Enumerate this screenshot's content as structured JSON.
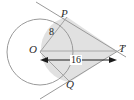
{
  "figure": {
    "type": "geometry-diagram",
    "width": 134,
    "height": 100,
    "background": "#ffffff"
  },
  "colors": {
    "stroke": "#8f8f8f",
    "stroke_dark": "#6f6f6f",
    "shade_fill": "#dcdcdc",
    "label_text": "#2b2b2b",
    "dimension": "#1c1c1c"
  },
  "points": {
    "center": {
      "label": "O",
      "x": 40,
      "y": 52
    },
    "tangent_upper": {
      "label": "P",
      "x": 67,
      "y": 17
    },
    "tangent_lower": {
      "label": "Q",
      "x": 70,
      "y": 82
    },
    "external": {
      "label": "T",
      "x": 117,
      "y": 51
    }
  },
  "labels": {
    "center": "O",
    "tangent_upper": "P",
    "tangent_lower": "Q",
    "external": "T",
    "radius": "8",
    "distance": "16"
  },
  "measurements": {
    "radius_value": "8",
    "radius_segment": "OP",
    "distance_value": "16",
    "distance_segment": "OT"
  },
  "geometry": {
    "circle": {
      "cx": 40,
      "cy": 52,
      "r": 33
    },
    "arc_shaded": true,
    "tangent_extends_beyond_points": true
  }
}
